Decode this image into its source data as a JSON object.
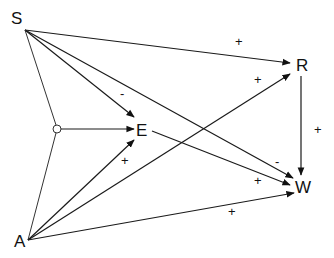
{
  "diagram": {
    "nodes": [
      {
        "id": "S",
        "label": "S",
        "x": 12,
        "y": 24
      },
      {
        "id": "R",
        "label": "R",
        "x": 296,
        "y": 71
      },
      {
        "id": "E",
        "label": "E",
        "x": 136,
        "y": 136
      },
      {
        "id": "W",
        "label": "W",
        "x": 296,
        "y": 193
      },
      {
        "id": "A",
        "label": "A",
        "x": 14,
        "y": 247
      }
    ],
    "junction": {
      "id": "J",
      "x": 57,
      "y": 129,
      "r": 4
    },
    "edges": [
      {
        "from": "S",
        "to": "R",
        "sign": "+"
      },
      {
        "from": "S",
        "to": "E",
        "sign": "-"
      },
      {
        "from": "S",
        "to": "W",
        "sign": "-"
      },
      {
        "from": "S",
        "to": "J",
        "sign": ""
      },
      {
        "from": "J",
        "to": "E",
        "sign": ""
      },
      {
        "from": "A",
        "to": "J",
        "sign": ""
      },
      {
        "from": "A",
        "to": "E",
        "sign": "+"
      },
      {
        "from": "A",
        "to": "R",
        "sign": "+"
      },
      {
        "from": "A",
        "to": "W",
        "sign": "+"
      },
      {
        "from": "E",
        "to": "W",
        "sign": "+"
      },
      {
        "from": "R",
        "to": "W",
        "sign": "+"
      }
    ],
    "labels": {
      "S": "S",
      "R": "R",
      "E": "E",
      "W": "W",
      "A": "A",
      "sign_S_R": "+",
      "sign_S_E": "-",
      "sign_S_W": "-",
      "sign_A_E": "+",
      "sign_A_R": "+",
      "sign_A_W": "+",
      "sign_E_W": "+",
      "sign_R_W": "+"
    }
  }
}
